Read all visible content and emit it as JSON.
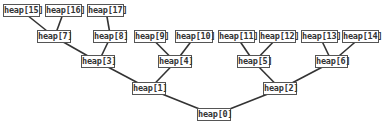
{
  "diagram": {
    "type": "binary-tree",
    "edge_color": "#333333",
    "node_border_color": "#555555",
    "nodes": [
      {
        "id": 0,
        "label": "heap[0]",
        "x": 197,
        "y": 108,
        "w": 35
      },
      {
        "id": 1,
        "label": "heap[1]",
        "x": 132,
        "y": 82,
        "w": 35
      },
      {
        "id": 2,
        "label": "heap[2]",
        "x": 263,
        "y": 82,
        "w": 35
      },
      {
        "id": 3,
        "label": "heap[3]",
        "x": 81,
        "y": 55,
        "w": 35
      },
      {
        "id": 4,
        "label": "heap[4]",
        "x": 158,
        "y": 55,
        "w": 35
      },
      {
        "id": 5,
        "label": "heap[5]",
        "x": 237,
        "y": 55,
        "w": 34
      },
      {
        "id": 6,
        "label": "heap[6]",
        "x": 315,
        "y": 55,
        "w": 34
      },
      {
        "id": 7,
        "label": "heap[7]",
        "x": 37,
        "y": 30,
        "w": 35
      },
      {
        "id": 8,
        "label": "heap[8]",
        "x": 93,
        "y": 30,
        "w": 35
      },
      {
        "id": 9,
        "label": "heap[9]",
        "x": 134,
        "y": 30,
        "w": 33
      },
      {
        "id": 10,
        "label": "heap[10]",
        "x": 175,
        "y": 30,
        "w": 39
      },
      {
        "id": 11,
        "label": "heap[11]",
        "x": 218,
        "y": 30,
        "w": 38
      },
      {
        "id": 12,
        "label": "heap[12]",
        "x": 259,
        "y": 30,
        "w": 38
      },
      {
        "id": 13,
        "label": "heap[13]",
        "x": 301,
        "y": 30,
        "w": 38
      },
      {
        "id": 14,
        "label": "heap[14]",
        "x": 342,
        "y": 30,
        "w": 38
      },
      {
        "id": 15,
        "label": "heap[15]",
        "x": 3,
        "y": 4,
        "w": 38
      },
      {
        "id": 16,
        "label": "heap[16]",
        "x": 45,
        "y": 4,
        "w": 38
      },
      {
        "id": 17,
        "label": "heap[17]",
        "x": 87,
        "y": 4,
        "w": 38
      }
    ],
    "edges": [
      [
        0,
        1
      ],
      [
        0,
        2
      ],
      [
        1,
        3
      ],
      [
        1,
        4
      ],
      [
        2,
        5
      ],
      [
        2,
        6
      ],
      [
        3,
        7
      ],
      [
        3,
        8
      ],
      [
        4,
        9
      ],
      [
        4,
        10
      ],
      [
        5,
        11
      ],
      [
        5,
        12
      ],
      [
        6,
        13
      ],
      [
        6,
        14
      ],
      [
        7,
        15
      ],
      [
        7,
        16
      ],
      [
        8,
        17
      ]
    ]
  }
}
